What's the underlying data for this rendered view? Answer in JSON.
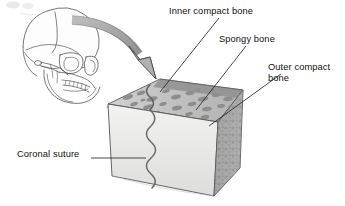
{
  "figure": {
    "background_color": "#ffffff",
    "ink_color": "#111111"
  },
  "labels": {
    "inner_compact_bone": "Inner compact bone",
    "spongy_bone": "Spongy bone",
    "outer_compact_bone": "Outer compact\nbone",
    "coronal_suture": "Coronal suture"
  },
  "illustration": {
    "skull": "lateral-view skull line drawing",
    "arrow": "curved gray magnification arrow",
    "block": "3D wedge block of cranial bone",
    "suture_line": "wavy vertical coronal suture"
  },
  "colors": {
    "outline": "#3c3c3c",
    "arrow_fill": "#a8a8a8",
    "arrow_stroke": "#4a4a4a",
    "front_face": "#e8e8e6",
    "top_face": "#bdbdbd",
    "side_face": "#a5a5a5",
    "spongy_blob": "#8e8e8e",
    "compact_band": "#9a9a9a"
  }
}
